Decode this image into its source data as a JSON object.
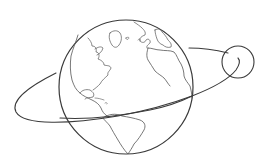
{
  "illustration": {
    "subject": "Earth with orbiting moon, line art",
    "colors": {
      "background": "#ffffff",
      "stroke": "#3a3a3a",
      "coast_stroke": "#555555"
    },
    "globe": {
      "cx": 126,
      "cy": 87,
      "r": 67
    },
    "moon": {
      "cx": 238,
      "cy": 62,
      "r": 16
    },
    "icons": [
      "globe-icon",
      "moon-icon",
      "orbit-path"
    ]
  }
}
